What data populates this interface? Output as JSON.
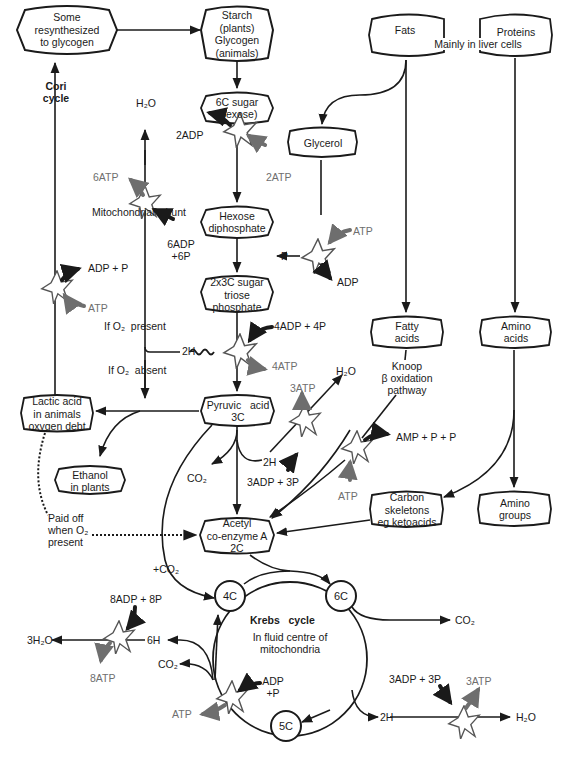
{
  "diagram": {
    "nodes": {
      "glycogen_resynth": {
        "lines": [
          "Some",
          "resynthesized",
          "to glycogen"
        ]
      },
      "starch": {
        "lines": [
          "Starch",
          "(plants)",
          "Glycogen",
          "(animals)"
        ]
      },
      "fats": {
        "label": "Fats"
      },
      "proteins": {
        "label": "Proteins"
      },
      "liver_note": "Mainly in liver cells",
      "hexose": {
        "lines": [
          "6C sugar",
          "(hexose)"
        ]
      },
      "glycerol": {
        "label": "Glycerol"
      },
      "hexose_diphosphate": {
        "lines": [
          "Hexose",
          "diphosphate"
        ]
      },
      "triose_phosphate": {
        "lines": [
          "2x3C sugar",
          "triose",
          "phosphate"
        ]
      },
      "fatty_acids": {
        "lines": [
          "Fatty",
          "acids"
        ]
      },
      "amino_acids": {
        "lines": [
          "Amino",
          "acids"
        ]
      },
      "lactic_acid": {
        "lines": [
          "Lactic acid",
          "in animals",
          "oxygen debt"
        ]
      },
      "pyruvic_acid": {
        "lines": [
          "Pyruvic   acid",
          "3C"
        ]
      },
      "ethanol": {
        "lines": [
          "Ethanol",
          "in plants"
        ]
      },
      "carbon_skeletons": {
        "lines": [
          "Carbon",
          "skeletons",
          "eg ketoacids"
        ]
      },
      "amino_groups": {
        "lines": [
          "Amino",
          "groups"
        ]
      },
      "acetyl_coa": {
        "lines": [
          "Acetyl",
          "co-enzyme A",
          "2C"
        ]
      },
      "krebs_4c": "4C",
      "krebs_6c": "6C",
      "krebs_5c": "5C"
    },
    "labels": {
      "cori_cycle": [
        "Cori",
        "cycle"
      ],
      "h2o_top": "H₂O",
      "adp2": "2ADP",
      "atp2": "2ATP",
      "atp6": "6ATP",
      "mito_shunt": "Mitochondrial  shunt",
      "adp6_p6": [
        "6ADP",
        "+6P"
      ],
      "atp_glycerol": "ATP",
      "adp_glycerol": "ADP",
      "p_glycerol": "P",
      "adp_p_cori": "ADP + P",
      "atp_cori": "ATP",
      "if_o2_present": "If O₂  present",
      "if_o2_absent": "If O₂  absent",
      "h2_tri": "2H",
      "adp4_p4": "4ADP + 4P",
      "atp4": "4ATP",
      "knoop": [
        "Knoop",
        "β oxidation",
        "pathway"
      ],
      "h2o_mid": "H₂O",
      "atp3_mid": "3ATP",
      "h2_pyr": "2H",
      "adp3_p3_mid": "3ADP + 3P",
      "co2_pyr": "CO₂",
      "amp_pp": "AMP + P + P",
      "atp_beta": "ATP",
      "paid_off": [
        "Paid off",
        "when O₂",
        "present"
      ],
      "plus_co2": "+CO₂",
      "adp8_p8": "8ADP + 8P",
      "h2o3": "3H₂O",
      "h6": "6H",
      "atp8": "8ATP",
      "co2_krebs_left": "CO₂",
      "adp_p_krebs": [
        "ADP",
        "+P"
      ],
      "atp_krebs": "ATP",
      "krebs_title": "Krebs   cycle",
      "krebs_sub": [
        "In fluid centre of",
        "mitochondria"
      ],
      "co2_krebs_right": "CO₂",
      "adp3_p3_bottom": "3ADP + 3P",
      "atp3_bottom": "3ATP",
      "h2_bottom": "2H",
      "h2o_bottom": "H₂O"
    },
    "colors": {
      "ink": "#1a1a1a",
      "grey_arrow": "#6e6e6e",
      "background": "#ffffff"
    }
  }
}
